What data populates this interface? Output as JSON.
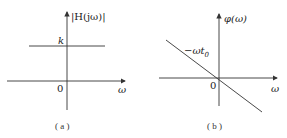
{
  "figure": {
    "panels": [
      {
        "id": "a",
        "caption": "( a )",
        "y_axis_label": "|H(jω)|",
        "x_axis_label": "ω",
        "origin_label": "0",
        "level_label": "k",
        "curve": "constant magnitude k"
      },
      {
        "id": "b",
        "caption": "( b )",
        "y_axis_label": "φ(ω)",
        "x_axis_label": "ω",
        "origin_label": "0",
        "line_label": "−ωt",
        "line_label_sub": "0",
        "curve": "linear phase through origin with negative slope"
      }
    ],
    "colors": {
      "line": "#333333",
      "background": "#ffffff"
    }
  }
}
